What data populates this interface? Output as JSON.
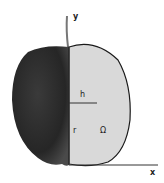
{
  "diagram": {
    "labels": {
      "y_axis": "y",
      "x_axis": "x",
      "height": "h",
      "radius": "r",
      "region": "Ω"
    },
    "colors": {
      "apple_skin": "#2a2a2a",
      "region_fill": "#d9d9d9",
      "outline": "#1a1a1a",
      "axis": "#333333",
      "stem": "#777777"
    }
  }
}
